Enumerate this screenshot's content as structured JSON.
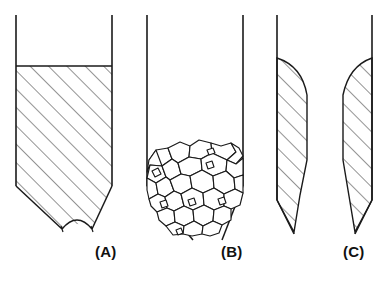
{
  "figure": {
    "type": "technical-line-diagram",
    "background_color": "#ffffff",
    "line_color": "#1a1a1a",
    "hatch_color": "#3a3a3a"
  },
  "panels": [
    {
      "id": "a",
      "label": "(A)",
      "content": "solid-hatched-fill-with-concave-bottom-meniscus",
      "wall_left_x": 16,
      "wall_right_x": 112,
      "wall_top_y": 15,
      "fill_top_y": 66,
      "taper_start_y": 186,
      "bottom_y": 234,
      "fill_style": "diagonal-hatch"
    },
    {
      "id": "b",
      "label": "(B)",
      "content": "angular-granular-particles-partial-fill",
      "wall_left_x": 147,
      "wall_right_x": 243,
      "wall_top_y": 15,
      "fill_top_y": 145,
      "taper_start_y": 186,
      "bottom_y": 240,
      "fill_style": "polygonal-grains"
    },
    {
      "id": "c",
      "label": "(C)",
      "content": "two-crescent-wall-films-tapering-to-points",
      "wall_left_x": 277,
      "wall_right_x": 372,
      "wall_top_y": 15,
      "fill_top_y": 58,
      "bottom_y": 236,
      "fill_style": "diagonal-hatch"
    }
  ],
  "labels": {
    "a": "(A)",
    "b": "(B)",
    "c": "(C)"
  }
}
